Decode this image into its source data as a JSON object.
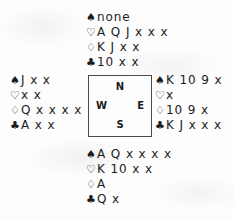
{
  "diagram": {
    "type": "bridge-hand-diagram",
    "suit_symbols": {
      "spades": "♠",
      "hearts": "♡",
      "diamonds": "♢",
      "clubs": "♣"
    },
    "compass": {
      "north": "N",
      "west": "W",
      "east": "E",
      "south": "S"
    },
    "hands": {
      "north": {
        "spades": "none",
        "hearts": "A Q J x x x",
        "diamonds": "K J x x",
        "clubs": "10 x x"
      },
      "west": {
        "spades": "J x x",
        "hearts": "x x",
        "diamonds": "Q x x x x",
        "clubs": "A x x"
      },
      "east": {
        "spades": "K 10 9 x",
        "hearts": "x",
        "diamonds": "10 9 x",
        "clubs": "K J x x x"
      },
      "south": {
        "spades": "A Q x x x x",
        "hearts": "K 10 x x",
        "diamonds": "A",
        "clubs": "Q x"
      }
    }
  }
}
